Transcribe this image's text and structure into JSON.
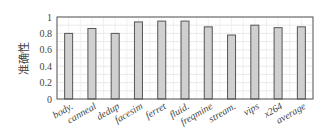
{
  "chart_data": {
    "type": "bar",
    "title": "",
    "xlabel": "",
    "ylabel": "准确性",
    "ylim": [
      0,
      1
    ],
    "yticks": [
      "0",
      "0.2",
      "0.4",
      "0.6",
      "0.8",
      "1"
    ],
    "grid": true,
    "legend": null,
    "categories": [
      "body.",
      "canneal",
      "dedup",
      "facesim",
      "ferret",
      "fluid.",
      "freqmine",
      "stream.",
      "vips",
      "x264",
      "average"
    ],
    "values": [
      0.8,
      0.86,
      0.8,
      0.94,
      0.95,
      0.95,
      0.88,
      0.78,
      0.9,
      0.87,
      0.88
    ],
    "bar_color": "#d0d0d0",
    "bar_edge": "#555555"
  }
}
